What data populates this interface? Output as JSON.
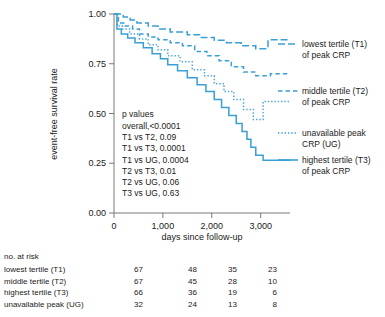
{
  "chart_data": {
    "type": "line",
    "title": "",
    "xlabel": "days since follow-up",
    "ylabel": "event-free survival rate",
    "xlim": [
      0,
      3600
    ],
    "ylim": [
      0,
      1.0
    ],
    "xticks": [
      0,
      1000,
      2000,
      3000
    ],
    "xticklabels": [
      "0",
      "1,000",
      "2,000",
      "3,000"
    ],
    "yticks": [
      0.0,
      0.25,
      0.5,
      0.75,
      1.0
    ],
    "yticklabels": [
      "0.00",
      "0.25",
      "0.50",
      "0.75",
      "1.00"
    ],
    "grid": false,
    "legend_position": "right",
    "line_color": "#3a9fd4",
    "series": [
      {
        "name": "lowest tertile (T1) of peak CRP",
        "short": "T1",
        "style": "long-dash",
        "color": "#3a9fd4",
        "points": [
          [
            0,
            1.0
          ],
          [
            190,
            1.0
          ],
          [
            190,
            0.985
          ],
          [
            330,
            0.985
          ],
          [
            330,
            0.97
          ],
          [
            470,
            0.97
          ],
          [
            470,
            0.955
          ],
          [
            700,
            0.955
          ],
          [
            700,
            0.94
          ],
          [
            900,
            0.94
          ],
          [
            900,
            0.925
          ],
          [
            1150,
            0.925
          ],
          [
            1150,
            0.91
          ],
          [
            1500,
            0.91
          ],
          [
            1500,
            0.896
          ],
          [
            1750,
            0.896
          ],
          [
            1750,
            0.882
          ],
          [
            2050,
            0.882
          ],
          [
            2050,
            0.868
          ],
          [
            2300,
            0.868
          ],
          [
            2300,
            0.855
          ],
          [
            2600,
            0.855
          ],
          [
            2600,
            0.84
          ],
          [
            2900,
            0.84
          ],
          [
            2900,
            0.826
          ],
          [
            3150,
            0.826
          ],
          [
            3150,
            0.87
          ],
          [
            3600,
            0.87
          ]
        ]
      },
      {
        "name": "middle tertile (T2) of peak CRP",
        "short": "T2",
        "style": "dash",
        "color": "#3a9fd4",
        "points": [
          [
            0,
            1.0
          ],
          [
            90,
            1.0
          ],
          [
            90,
            0.955
          ],
          [
            200,
            0.955
          ],
          [
            200,
            0.94
          ],
          [
            380,
            0.94
          ],
          [
            380,
            0.925
          ],
          [
            520,
            0.925
          ],
          [
            520,
            0.9
          ],
          [
            700,
            0.9
          ],
          [
            700,
            0.885
          ],
          [
            900,
            0.885
          ],
          [
            900,
            0.87
          ],
          [
            1150,
            0.87
          ],
          [
            1150,
            0.855
          ],
          [
            1400,
            0.855
          ],
          [
            1400,
            0.84
          ],
          [
            1650,
            0.84
          ],
          [
            1650,
            0.812
          ],
          [
            1900,
            0.812
          ],
          [
            1900,
            0.79
          ],
          [
            2150,
            0.79
          ],
          [
            2150,
            0.765
          ],
          [
            2400,
            0.765
          ],
          [
            2400,
            0.735
          ],
          [
            2650,
            0.735
          ],
          [
            2650,
            0.708
          ],
          [
            2900,
            0.708
          ],
          [
            2900,
            0.69
          ],
          [
            3200,
            0.69
          ],
          [
            3200,
            0.7
          ],
          [
            3600,
            0.7
          ]
        ]
      },
      {
        "name": "unavailable peak CRP (UG)",
        "short": "UG",
        "style": "dot",
        "color": "#4aa8d8",
        "points": [
          [
            0,
            1.0
          ],
          [
            70,
            1.0
          ],
          [
            70,
            0.94
          ],
          [
            170,
            0.94
          ],
          [
            170,
            0.925
          ],
          [
            320,
            0.925
          ],
          [
            320,
            0.9
          ],
          [
            520,
            0.9
          ],
          [
            520,
            0.875
          ],
          [
            700,
            0.875
          ],
          [
            700,
            0.845
          ],
          [
            900,
            0.845
          ],
          [
            900,
            0.82
          ],
          [
            1100,
            0.82
          ],
          [
            1100,
            0.79
          ],
          [
            1350,
            0.79
          ],
          [
            1350,
            0.76
          ],
          [
            1600,
            0.76
          ],
          [
            1600,
            0.72
          ],
          [
            1850,
            0.72
          ],
          [
            1850,
            0.69
          ],
          [
            2050,
            0.69
          ],
          [
            2050,
            0.65
          ],
          [
            2250,
            0.65
          ],
          [
            2250,
            0.61
          ],
          [
            2450,
            0.61
          ],
          [
            2450,
            0.57
          ],
          [
            2650,
            0.57
          ],
          [
            2650,
            0.52
          ],
          [
            2850,
            0.52
          ],
          [
            2850,
            0.47
          ],
          [
            3050,
            0.47
          ],
          [
            3050,
            0.56
          ],
          [
            3600,
            0.56
          ]
        ]
      },
      {
        "name": "highest tertile (T3) of peak CRP",
        "short": "T3",
        "style": "solid",
        "color": "#3a9fd4",
        "points": [
          [
            0,
            1.0
          ],
          [
            60,
            1.0
          ],
          [
            60,
            0.925
          ],
          [
            150,
            0.925
          ],
          [
            150,
            0.9
          ],
          [
            280,
            0.9
          ],
          [
            280,
            0.88
          ],
          [
            430,
            0.88
          ],
          [
            430,
            0.855
          ],
          [
            600,
            0.855
          ],
          [
            600,
            0.83
          ],
          [
            780,
            0.83
          ],
          [
            780,
            0.8
          ],
          [
            950,
            0.8
          ],
          [
            950,
            0.775
          ],
          [
            1100,
            0.775
          ],
          [
            1100,
            0.745
          ],
          [
            1300,
            0.745
          ],
          [
            1300,
            0.715
          ],
          [
            1500,
            0.715
          ],
          [
            1500,
            0.68
          ],
          [
            1700,
            0.68
          ],
          [
            1700,
            0.645
          ],
          [
            1880,
            0.645
          ],
          [
            1880,
            0.61
          ],
          [
            2050,
            0.61
          ],
          [
            2050,
            0.57
          ],
          [
            2200,
            0.57
          ],
          [
            2200,
            0.53
          ],
          [
            2350,
            0.53
          ],
          [
            2350,
            0.49
          ],
          [
            2500,
            0.49
          ],
          [
            2500,
            0.45
          ],
          [
            2620,
            0.45
          ],
          [
            2620,
            0.41
          ],
          [
            2720,
            0.41
          ],
          [
            2720,
            0.37
          ],
          [
            2800,
            0.37
          ],
          [
            2800,
            0.33
          ],
          [
            2900,
            0.33
          ],
          [
            2900,
            0.29
          ],
          [
            3050,
            0.29
          ],
          [
            3050,
            0.265
          ],
          [
            3600,
            0.265
          ]
        ]
      }
    ]
  },
  "pvalues": {
    "heading": "p values",
    "lines": [
      "overall,<0.0001",
      "T1 vs T2, 0.09",
      "T1 vs T3, 0.0001",
      "T1 vs UG, 0.0004",
      "T2 vs T3, 0.01",
      "T2 vs UG, 0.06",
      "T3 vs UG, 0.63"
    ]
  },
  "legend": [
    {
      "line1": "lowest tertile (T1)",
      "line2": "of peak CRP",
      "style": "long-dash"
    },
    {
      "line1": "middle tertile (T2)",
      "line2": "of peak CRP",
      "style": "dash"
    },
    {
      "line1": "unavailable peak",
      "line2": "CRP (UG)",
      "style": "dot"
    },
    {
      "line1": "highest tertile (T3)",
      "line2": "of peak CRP",
      "style": "solid"
    }
  ],
  "risk_table": {
    "title": "no. at risk",
    "rows": [
      {
        "label": "lowest tertile (T1)",
        "values": [
          "67",
          "48",
          "35",
          "23"
        ]
      },
      {
        "label": "middle tertile (T2)",
        "values": [
          "67",
          "45",
          "28",
          "10"
        ]
      },
      {
        "label": "highest tertile (T3)",
        "values": [
          "66",
          "36",
          "19",
          "6"
        ]
      },
      {
        "label": "unavailable peak (UG)",
        "values": [
          "32",
          "24",
          "13",
          "8"
        ]
      }
    ]
  }
}
